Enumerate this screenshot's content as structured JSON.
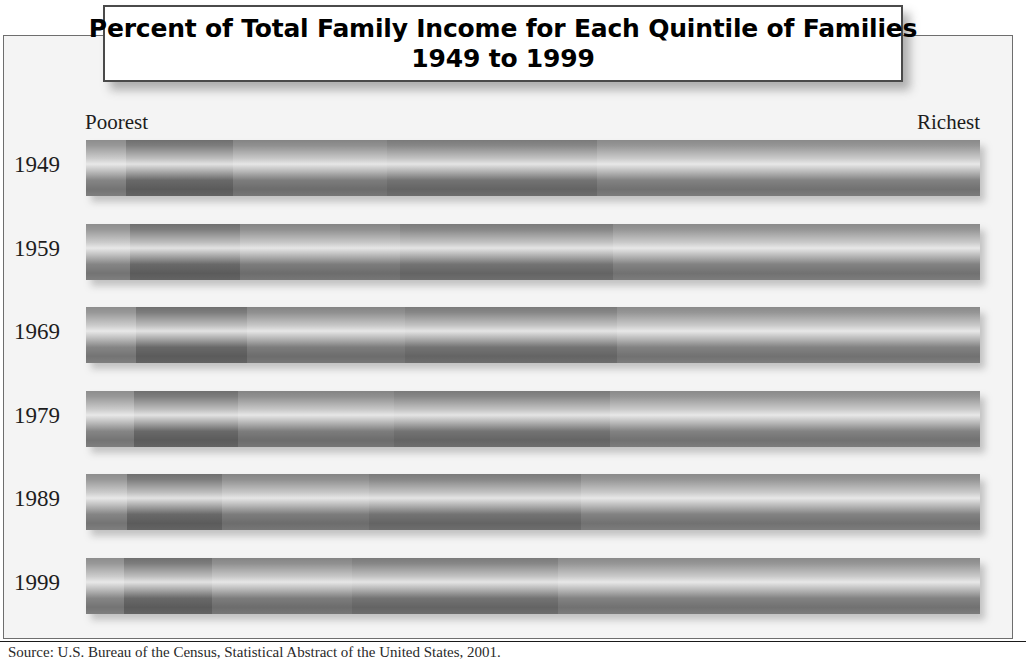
{
  "title": {
    "line1": "Percent of Total Family Income for Each Quintile of Families",
    "line2": "1949 to 1999"
  },
  "axis": {
    "left_end_label": "Poorest",
    "right_end_label": "Richest"
  },
  "source": {
    "text": "Source: U.S. Bureau of the Census, Statistical Abstract of the United States, 2001."
  },
  "colors": {
    "frame_border": "#6e6e6e",
    "plate_border": "#4a4a4a",
    "background": "#f4f4f4",
    "quintile_1": "#8d8d8d",
    "quintile_2": "#6f6f6f",
    "quintile_3": "#848484",
    "quintile_4": "#7a7a7a",
    "quintile_5": "#8a8a8a"
  },
  "chart_data": {
    "type": "bar",
    "title": "Percent of Total Family Income for Each Quintile of Families 1949 to 1999",
    "subtitle": "1949 to 1999",
    "orientation": "horizontal",
    "stacked": true,
    "xlabel": "",
    "ylabel": "",
    "xlim": [
      0,
      100
    ],
    "grid": false,
    "legend": "none",
    "annotations": [
      "Poorest",
      "Richest"
    ],
    "categories": [
      "1949",
      "1959",
      "1969",
      "1979",
      "1989",
      "1999"
    ],
    "series": [
      {
        "name": "Lowest fifth (Poorest)",
        "values": [
          4.5,
          4.9,
          5.6,
          5.4,
          4.6,
          4.3
        ]
      },
      {
        "name": "Second fifth",
        "values": [
          11.9,
          12.3,
          12.4,
          11.6,
          10.6,
          9.8
        ]
      },
      {
        "name": "Third fifth",
        "values": [
          17.3,
          17.9,
          17.7,
          17.5,
          16.5,
          15.7
        ]
      },
      {
        "name": "Fourth fifth",
        "values": [
          23.5,
          23.8,
          23.7,
          24.1,
          23.7,
          23.0
        ]
      },
      {
        "name": "Highest fifth (Richest)",
        "values": [
          42.8,
          41.1,
          40.6,
          41.4,
          44.6,
          47.2
        ]
      }
    ]
  },
  "rows": [
    {
      "year": "1949",
      "segments": [
        {
          "label": "Lowest fifth",
          "percent": 4.5
        },
        {
          "label": "Second fifth",
          "percent": 11.9
        },
        {
          "label": "Third fifth",
          "percent": 17.3
        },
        {
          "label": "Fourth fifth",
          "percent": 23.5
        },
        {
          "label": "Highest fifth",
          "percent": 42.8
        }
      ]
    },
    {
      "year": "1959",
      "segments": [
        {
          "label": "Lowest fifth",
          "percent": 4.9
        },
        {
          "label": "Second fifth",
          "percent": 12.3
        },
        {
          "label": "Third fifth",
          "percent": 17.9
        },
        {
          "label": "Fourth fifth",
          "percent": 23.8
        },
        {
          "label": "Highest fifth",
          "percent": 41.1
        }
      ]
    },
    {
      "year": "1969",
      "segments": [
        {
          "label": "Lowest fifth",
          "percent": 5.6
        },
        {
          "label": "Second fifth",
          "percent": 12.4
        },
        {
          "label": "Third fifth",
          "percent": 17.7
        },
        {
          "label": "Fourth fifth",
          "percent": 23.7
        },
        {
          "label": "Highest fifth",
          "percent": 40.6
        }
      ]
    },
    {
      "year": "1979",
      "segments": [
        {
          "label": "Lowest fifth",
          "percent": 5.4
        },
        {
          "label": "Second fifth",
          "percent": 11.6
        },
        {
          "label": "Third fifth",
          "percent": 17.5
        },
        {
          "label": "Fourth fifth",
          "percent": 24.1
        },
        {
          "label": "Highest fifth",
          "percent": 41.4
        }
      ]
    },
    {
      "year": "1989",
      "segments": [
        {
          "label": "Lowest fifth",
          "percent": 4.6
        },
        {
          "label": "Second fifth",
          "percent": 10.6
        },
        {
          "label": "Third fifth",
          "percent": 16.5
        },
        {
          "label": "Fourth fifth",
          "percent": 23.7
        },
        {
          "label": "Highest fifth",
          "percent": 44.6
        }
      ]
    },
    {
      "year": "1999",
      "segments": [
        {
          "label": "Lowest fifth",
          "percent": 4.3
        },
        {
          "label": "Second fifth",
          "percent": 9.8
        },
        {
          "label": "Third fifth",
          "percent": 15.7
        },
        {
          "label": "Fourth fifth",
          "percent": 23.0
        },
        {
          "label": "Highest fifth",
          "percent": 47.2
        }
      ]
    }
  ]
}
